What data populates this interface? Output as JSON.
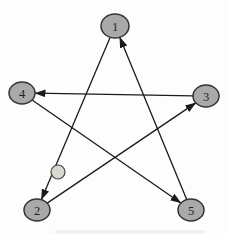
{
  "graph": {
    "type": "directed-graph",
    "layout": "pentagram",
    "colors": {
      "node_fill": "#a9a9a9",
      "node_stroke": "#333333",
      "small_node_fill": "#d8d8d0",
      "small_node_stroke": "#444444",
      "edge": "#1a1a1a",
      "label": "#1f1f1f",
      "background": "#fdfdfd"
    },
    "nodes": [
      {
        "id": "1",
        "label": "1",
        "x": 115,
        "y": 26,
        "rx": 14,
        "ry": 12
      },
      {
        "id": "2",
        "label": "2",
        "x": 37,
        "y": 210,
        "rx": 13,
        "ry": 11
      },
      {
        "id": "3",
        "label": "3",
        "x": 206,
        "y": 96,
        "rx": 13,
        "ry": 11
      },
      {
        "id": "4",
        "label": "4",
        "x": 22,
        "y": 93,
        "rx": 13,
        "ry": 11
      },
      {
        "id": "5",
        "label": "5",
        "x": 191,
        "y": 210,
        "rx": 13,
        "ry": 11
      }
    ],
    "small_node": {
      "id": "unlabeled",
      "label": "",
      "x": 58,
      "y": 172,
      "r": 7
    },
    "edges": [
      {
        "from": "1",
        "to": "2"
      },
      {
        "from": "2",
        "to": "3"
      },
      {
        "from": "3",
        "to": "4"
      },
      {
        "from": "4",
        "to": "5"
      },
      {
        "from": "5",
        "to": "1"
      }
    ]
  }
}
